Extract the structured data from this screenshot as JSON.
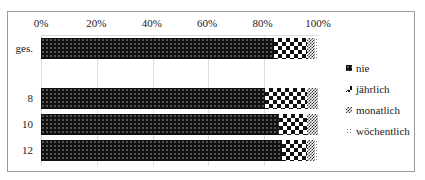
{
  "chart_data": {
    "type": "bar",
    "orientation": "horizontal",
    "stacked": true,
    "percent": true,
    "title": "",
    "xlabel": "",
    "ylabel": "",
    "xlim": [
      0,
      100
    ],
    "x_ticks": [
      "0%",
      "20%",
      "40%",
      "60%",
      "80%",
      "100%"
    ],
    "grid": true,
    "legend_position": "right",
    "categories": [
      "ges.",
      "8",
      "10",
      "12"
    ],
    "series": [
      {
        "name": "nie",
        "values": [
          84,
          81,
          86,
          87
        ]
      },
      {
        "name": "jährlich",
        "values": [
          12,
          15,
          10,
          9
        ]
      },
      {
        "name": "monatlich",
        "values": [
          3,
          4,
          4,
          3
        ]
      },
      {
        "name": "wöchentlich",
        "values": [
          1,
          0,
          0,
          1
        ]
      }
    ]
  },
  "legend": [
    "nie",
    "jährlich",
    "monatlich",
    "wöchentlich"
  ]
}
